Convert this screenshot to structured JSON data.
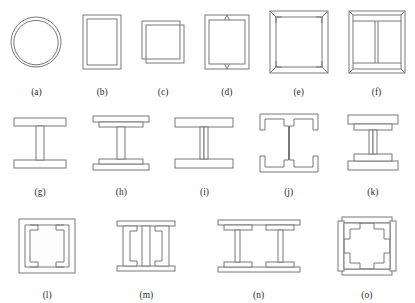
{
  "figure": {
    "kind": "structural-cross-section-plate",
    "stroke_color": "#77787a",
    "fill_color": "#fdfdfd",
    "background_color": "#ffffff",
    "rows": [
      {
        "items": [
          {
            "label": "(a)",
            "name": "circular-hollow-section",
            "shape": "circle-tube"
          },
          {
            "label": "(b)",
            "name": "rectangular-hollow-section",
            "shape": "rect-tube"
          },
          {
            "label": "(c)",
            "name": "square-hollow-section-offset",
            "shape": "rect-tube-offset"
          },
          {
            "label": "(d)",
            "name": "rectangular-hollow-section-seam",
            "shape": "rect-tube-seam"
          },
          {
            "label": "(e)",
            "name": "built-up-box-corner-angles",
            "shape": "box-corner-angles"
          },
          {
            "label": "(f)",
            "name": "built-up-box-center-web",
            "shape": "box-center-web"
          }
        ]
      },
      {
        "items": [
          {
            "label": "(g)",
            "name": "i-section-plain",
            "shape": "i-plain"
          },
          {
            "label": "(h)",
            "name": "i-section-double-flange",
            "shape": "i-double-flange"
          },
          {
            "label": "(i)",
            "name": "i-section-twin-web",
            "shape": "i-twin-web"
          },
          {
            "label": "(j)",
            "name": "i-section-lipped-flanges",
            "shape": "i-lipped"
          },
          {
            "label": "(k)",
            "name": "i-section-stacked-flange-plates",
            "shape": "i-stacked-plates"
          }
        ]
      },
      {
        "items": [
          {
            "label": "(l)",
            "name": "box-section-inner-lips",
            "shape": "box-inner-lips"
          },
          {
            "label": "(m)",
            "name": "double-channel-back-to-back",
            "shape": "double-channel"
          },
          {
            "label": "(n)",
            "name": "double-i-section-plated",
            "shape": "double-i-plated"
          },
          {
            "label": "(o)",
            "name": "box-section-corner-lips",
            "shape": "box-corner-lips"
          }
        ]
      }
    ]
  }
}
